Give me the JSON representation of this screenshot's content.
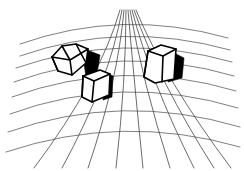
{
  "image": {
    "title": "Wireframe boxes on curved perspective grid",
    "background_color": "#ffffff",
    "line_color": "#000000",
    "grid_color": "#3a3a3a",
    "shadow_color": "#000000",
    "width": 244,
    "height": 171
  },
  "grid": {
    "name": "curved-perspective-grid",
    "type": "fisheye-ground-plane",
    "horizontal_line_count": 8,
    "vertical_line_count": 9,
    "description": "Arched horizontal lines curving downward toward the left and right edges, crossed by converging vertical lines fanning out from a vanishing point above the top edge",
    "horizontals": [
      "M 20 44 Q 122 8 228 38",
      "M 20 56 Q 122 20 230 50",
      "M 16 68 Q 122 31 232 62",
      "M 14 82 Q 122 43 234 76",
      "M 12 97 Q 122 57 236 91",
      "M 10 114 Q 122 73 238 108",
      "M 8 132 Q 122 92 240 127",
      "M 6 152 Q 122 113 240 147"
    ],
    "verticals": [
      "M 120 10 Q 100 80 34 168",
      "M 122 10 Q 110 80 62 168",
      "M 124 10 Q 118 80 88 168",
      "M 126 10 Q 126 80 116 168",
      "M 128 10 Q 134 80 143 168",
      "M 130 10 Q 142 80 170 168",
      "M 132 10 Q 150 80 194 168",
      "M 134 10 Q 158 80 214 168",
      "M 136 10 Q 165 80 231 168"
    ]
  },
  "objects": [
    {
      "name": "left-cube",
      "label": "Wireframe cube seen from corner (hexagonal silhouette)",
      "position": "left",
      "has_shadow": true,
      "silhouette": "M 52 57 L 62 46 L 76 44 L 88 49 L 86 63 L 72 75 L 58 71 Z",
      "internal_edges": [
        "M 52 57 L 70 60 L 88 49",
        "M 70 60 L 72 75",
        "M 62 46 L 70 60",
        "M 76 44 L 86 63",
        "M 58 71 L 52 57"
      ],
      "shadow": "M 87 50 L 100 55 L 97 74 L 86 77 L 84 63 Z"
    },
    {
      "name": "center-box",
      "label": "Wireframe rectangular box, front-facing",
      "position": "center",
      "has_shadow": true,
      "silhouette": "M 83 76 L 100 70 L 110 74 L 109 95 L 92 102 L 82 97 Z",
      "internal_edges": [
        "M 83 76 L 94 81 L 110 74",
        "M 94 81 L 92 102",
        "M 83 76 L 82 97"
      ],
      "shadow": "M 106 73 L 113 76 L 112 97 L 103 100 L 104 80 Z"
    },
    {
      "name": "right-box",
      "label": "Wireframe rectangular box, tall, right side",
      "position": "right",
      "has_shadow": true,
      "silhouette": "M 148 51 L 161 45 L 176 49 L 174 79 L 155 83 L 144 77 Z",
      "internal_edges": [
        "M 148 51 L 163 56 L 176 49",
        "M 163 56 L 162 82",
        "M 148 51 L 144 77"
      ],
      "shadow": "M 172 52 L 184 58 L 182 78 L 168 82 L 170 62 Z"
    }
  ]
}
